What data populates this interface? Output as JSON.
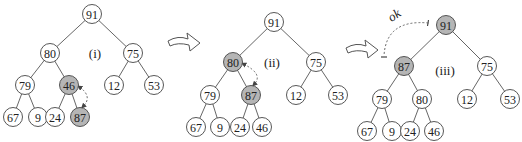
{
  "diagram": {
    "colors": {
      "highlight": "#b5b5b5",
      "stroke": "#444444",
      "background": "#ffffff"
    },
    "trees": [
      {
        "caption": "(i)",
        "caption_pos": [
          95,
          53
        ],
        "nodes": [
          {
            "id": "a0",
            "value": "91",
            "x": 92,
            "y": 14,
            "highlight": false
          },
          {
            "id": "a1",
            "value": "80",
            "x": 50,
            "y": 53,
            "highlight": false
          },
          {
            "id": "a2",
            "value": "75",
            "x": 133,
            "y": 53,
            "highlight": false
          },
          {
            "id": "a3",
            "value": "79",
            "x": 25,
            "y": 85,
            "highlight": false
          },
          {
            "id": "a4",
            "value": "46",
            "x": 69,
            "y": 85,
            "highlight": true
          },
          {
            "id": "a5",
            "value": "12",
            "x": 114,
            "y": 85,
            "highlight": false
          },
          {
            "id": "a6",
            "value": "53",
            "x": 154,
            "y": 85,
            "highlight": false
          },
          {
            "id": "a7",
            "value": "67",
            "x": 13,
            "y": 117,
            "highlight": false
          },
          {
            "id": "a8",
            "value": "9",
            "x": 38,
            "y": 117,
            "highlight": false
          },
          {
            "id": "a9",
            "value": "24",
            "x": 55,
            "y": 117,
            "highlight": false
          },
          {
            "id": "a10",
            "value": "87",
            "x": 80,
            "y": 117,
            "highlight": true
          }
        ],
        "edges": [
          [
            "a0",
            "a1"
          ],
          [
            "a0",
            "a2"
          ],
          [
            "a1",
            "a3"
          ],
          [
            "a1",
            "a4"
          ],
          [
            "a2",
            "a5"
          ],
          [
            "a2",
            "a6"
          ],
          [
            "a3",
            "a7"
          ],
          [
            "a3",
            "a8"
          ],
          [
            "a4",
            "a9"
          ],
          [
            "a4",
            "a10"
          ]
        ],
        "swap": {
          "from": "a4",
          "to": "a10"
        }
      },
      {
        "caption": "(ii)",
        "caption_pos": [
          272,
          62
        ],
        "nodes": [
          {
            "id": "b0",
            "value": "91",
            "x": 274,
            "y": 22,
            "highlight": false
          },
          {
            "id": "b1",
            "value": "80",
            "x": 233,
            "y": 62,
            "highlight": true
          },
          {
            "id": "b2",
            "value": "75",
            "x": 316,
            "y": 62,
            "highlight": false
          },
          {
            "id": "b3",
            "value": "79",
            "x": 210,
            "y": 95,
            "highlight": false
          },
          {
            "id": "b4",
            "value": "87",
            "x": 251,
            "y": 95,
            "highlight": true
          },
          {
            "id": "b5",
            "value": "12",
            "x": 296,
            "y": 95,
            "highlight": false
          },
          {
            "id": "b6",
            "value": "53",
            "x": 338,
            "y": 95,
            "highlight": false
          },
          {
            "id": "b7",
            "value": "67",
            "x": 196,
            "y": 127,
            "highlight": false
          },
          {
            "id": "b8",
            "value": "9",
            "x": 220,
            "y": 127,
            "highlight": false
          },
          {
            "id": "b9",
            "value": "24",
            "x": 240,
            "y": 127,
            "highlight": false
          },
          {
            "id": "b10",
            "value": "46",
            "x": 262,
            "y": 127,
            "highlight": false
          }
        ],
        "edges": [
          [
            "b0",
            "b1"
          ],
          [
            "b0",
            "b2"
          ],
          [
            "b1",
            "b3"
          ],
          [
            "b1",
            "b4"
          ],
          [
            "b2",
            "b5"
          ],
          [
            "b2",
            "b6"
          ],
          [
            "b3",
            "b7"
          ],
          [
            "b3",
            "b8"
          ],
          [
            "b4",
            "b9"
          ],
          [
            "b4",
            "b10"
          ]
        ],
        "swap": {
          "from": "b1",
          "to": "b4"
        }
      },
      {
        "caption": "(iii)",
        "caption_pos": [
          445,
          70
        ],
        "nodes": [
          {
            "id": "c0",
            "value": "91",
            "x": 446,
            "y": 25,
            "highlight": true
          },
          {
            "id": "c1",
            "value": "87",
            "x": 404,
            "y": 66,
            "highlight": true
          },
          {
            "id": "c2",
            "value": "75",
            "x": 487,
            "y": 66,
            "highlight": false
          },
          {
            "id": "c3",
            "value": "79",
            "x": 382,
            "y": 99,
            "highlight": false
          },
          {
            "id": "c4",
            "value": "80",
            "x": 422,
            "y": 99,
            "highlight": false
          },
          {
            "id": "c5",
            "value": "12",
            "x": 467,
            "y": 99,
            "highlight": false
          },
          {
            "id": "c6",
            "value": "53",
            "x": 510,
            "y": 99,
            "highlight": false
          },
          {
            "id": "c7",
            "value": "67",
            "x": 367,
            "y": 131,
            "highlight": false
          },
          {
            "id": "c8",
            "value": "9",
            "x": 392,
            "y": 131,
            "highlight": false
          },
          {
            "id": "c9",
            "value": "24",
            "x": 410,
            "y": 131,
            "highlight": false
          },
          {
            "id": "c10",
            "value": "46",
            "x": 434,
            "y": 131,
            "highlight": false
          }
        ],
        "edges": [
          [
            "c0",
            "c1"
          ],
          [
            "c0",
            "c2"
          ],
          [
            "c1",
            "c3"
          ],
          [
            "c1",
            "c4"
          ],
          [
            "c2",
            "c5"
          ],
          [
            "c2",
            "c6"
          ],
          [
            "c3",
            "c7"
          ],
          [
            "c3",
            "c8"
          ],
          [
            "c4",
            "c9"
          ],
          [
            "c4",
            "c10"
          ]
        ],
        "ok_label": "ok"
      }
    ],
    "transition_arrows": [
      {
        "id": "arrow-1",
        "x": 168,
        "y": 33
      },
      {
        "id": "arrow-2",
        "x": 346,
        "y": 40
      }
    ]
  }
}
